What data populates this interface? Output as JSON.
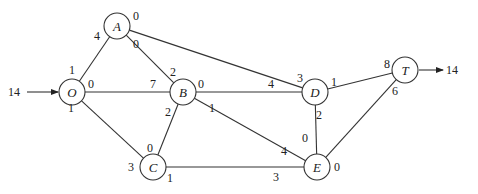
{
  "diagram": {
    "type": "network-flow",
    "source_flow": {
      "value": "14",
      "x": 8,
      "y": 96,
      "arrow_from": [
        27,
        92
      ],
      "arrow_to": [
        58,
        92
      ]
    },
    "sink_flow": {
      "value": "14",
      "x": 446,
      "y": 74,
      "arrow_from": [
        419,
        70
      ],
      "arrow_to": [
        443,
        70
      ]
    },
    "nodes": [
      {
        "id": "O",
        "label": "O",
        "x": 72,
        "y": 92
      },
      {
        "id": "A",
        "label": "A",
        "x": 117,
        "y": 26
      },
      {
        "id": "B",
        "label": "B",
        "x": 183,
        "y": 92
      },
      {
        "id": "C",
        "label": "C",
        "x": 153,
        "y": 167
      },
      {
        "id": "D",
        "label": "D",
        "x": 315,
        "y": 92
      },
      {
        "id": "E",
        "label": "E",
        "x": 317,
        "y": 167
      },
      {
        "id": "T",
        "label": "T",
        "x": 405,
        "y": 70
      }
    ],
    "edges": [
      {
        "from": "O",
        "to": "A"
      },
      {
        "from": "O",
        "to": "B"
      },
      {
        "from": "O",
        "to": "C"
      },
      {
        "from": "A",
        "to": "B"
      },
      {
        "from": "A",
        "to": "D"
      },
      {
        "from": "B",
        "to": "C"
      },
      {
        "from": "B",
        "to": "D"
      },
      {
        "from": "B",
        "to": "E"
      },
      {
        "from": "C",
        "to": "E"
      },
      {
        "from": "D",
        "to": "E"
      },
      {
        "from": "D",
        "to": "T"
      },
      {
        "from": "E",
        "to": "T"
      }
    ],
    "edge_labels": [
      {
        "text": "4",
        "x": 94,
        "y": 40,
        "edge": "O-A",
        "end": "A"
      },
      {
        "text": "1",
        "x": 69,
        "y": 74,
        "edge": "O-A",
        "end": "O"
      },
      {
        "text": "0",
        "x": 133,
        "y": 20,
        "edge": "A-D",
        "end": "A"
      },
      {
        "text": "3",
        "x": 297,
        "y": 82,
        "edge": "A-D",
        "end": "D"
      },
      {
        "text": "0",
        "x": 133,
        "y": 48,
        "edge": "A-B",
        "end": "A"
      },
      {
        "text": "2",
        "x": 170,
        "y": 76,
        "edge": "A-B",
        "end": "B"
      },
      {
        "text": "0",
        "x": 88,
        "y": 88,
        "edge": "O-B",
        "end": "O"
      },
      {
        "text": "7",
        "x": 150,
        "y": 88,
        "edge": "O-B",
        "end": "B"
      },
      {
        "text": "0",
        "x": 198,
        "y": 88,
        "edge": "B-D",
        "end": "B"
      },
      {
        "text": "4",
        "x": 268,
        "y": 88,
        "edge": "B-D",
        "end": "D"
      },
      {
        "text": "1",
        "x": 68,
        "y": 112,
        "edge": "O-C",
        "end": "O"
      },
      {
        "text": "3",
        "x": 128,
        "y": 171,
        "edge": "O-C",
        "end": "C"
      },
      {
        "text": "2",
        "x": 165,
        "y": 116,
        "edge": "B-C",
        "end": "B"
      },
      {
        "text": "0",
        "x": 147,
        "y": 152,
        "edge": "B-C",
        "end": "C"
      },
      {
        "text": "1",
        "x": 209,
        "y": 112,
        "edge": "B-E",
        "end": "B"
      },
      {
        "text": "4",
        "x": 281,
        "y": 155,
        "edge": "B-E",
        "end": "E"
      },
      {
        "text": "1",
        "x": 167,
        "y": 182,
        "edge": "C-E",
        "end": "C"
      },
      {
        "text": "3",
        "x": 273,
        "y": 181,
        "edge": "C-E",
        "end": "E"
      },
      {
        "text": "2",
        "x": 316,
        "y": 119,
        "edge": "D-E",
        "end": "D"
      },
      {
        "text": "0",
        "x": 302,
        "y": 142,
        "edge": "D-E",
        "end": "E"
      },
      {
        "text": "1",
        "x": 331,
        "y": 86,
        "edge": "D-T",
        "end": "D"
      },
      {
        "text": "8",
        "x": 384,
        "y": 68,
        "edge": "D-T",
        "end": "T"
      },
      {
        "text": "6",
        "x": 392,
        "y": 95,
        "edge": "E-T",
        "end": "T"
      },
      {
        "text": "0",
        "x": 334,
        "y": 171,
        "edge": "E-T",
        "end": "E"
      }
    ]
  }
}
